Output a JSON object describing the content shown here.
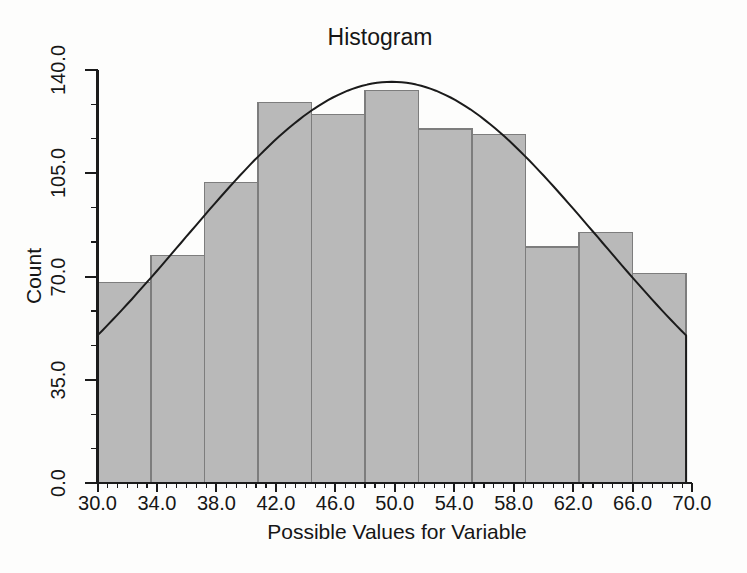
{
  "figure": {
    "title": "Histogram",
    "x_axis": {
      "label": "Possible Values for Variable",
      "major_tick_labels": [
        "30.0",
        "34.0",
        "38.0",
        "42.0",
        "46.0",
        "50.0",
        "54.0",
        "58.0",
        "62.0",
        "66.0",
        "70.0"
      ],
      "minor_ticks_between_major": 5
    },
    "y_axis": {
      "label": "Count",
      "major_tick_labels": [
        "0.0",
        "35.0",
        "70.0",
        "105.0",
        "140.0"
      ],
      "minor_ticks_between_major": 2
    },
    "colors": {
      "background": "#fdfdfc",
      "bar_fill": "#b9b9b9",
      "bar_border": "#7d7d7d",
      "axis": "#1b1b1b",
      "curve": "#1b1b1b",
      "text": "#161616"
    }
  },
  "chart_data": {
    "type": "bar",
    "subtype": "histogram",
    "title": "Histogram",
    "xlabel": "Possible Values for Variable",
    "ylabel": "Count",
    "xlim": [
      30,
      70
    ],
    "ylim": [
      0,
      140
    ],
    "grid": false,
    "legend": null,
    "x_major_ticks": [
      30,
      34,
      38,
      42,
      46,
      50,
      54,
      58,
      62,
      66,
      70
    ],
    "x_minor_tick_step": 0.6667,
    "y_major_ticks": [
      0,
      35,
      70,
      105,
      140
    ],
    "y_minor_tick_step": 11.6667,
    "bin_edges": [
      30.0,
      33.6,
      37.2,
      40.8,
      44.4,
      48.0,
      51.6,
      55.2,
      58.8,
      62.4,
      66.0,
      69.6
    ],
    "counts": [
      68,
      77,
      102,
      129,
      125,
      133,
      120,
      118,
      80,
      85,
      71
    ],
    "normal_curve": {
      "mean": 49.8,
      "sd": 14.0,
      "peak": 136
    }
  }
}
